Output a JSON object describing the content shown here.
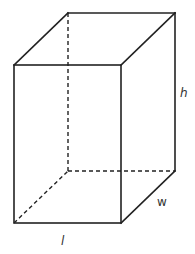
{
  "diagram": {
    "labels": {
      "height": "h",
      "width": "w",
      "length": "l"
    },
    "colors": {
      "stroke": "#222222",
      "label": "#333333",
      "background": "#ffffff"
    },
    "vertices": {
      "front_top_left": [
        14,
        65
      ],
      "front_top_right": [
        121,
        65
      ],
      "front_bottom_left": [
        14,
        223
      ],
      "front_bottom_right": [
        121,
        223
      ],
      "back_top_left": [
        68,
        13
      ],
      "back_top_right": [
        175,
        13
      ],
      "back_bottom_left": [
        68,
        171
      ],
      "back_bottom_right": [
        175,
        171
      ]
    }
  }
}
